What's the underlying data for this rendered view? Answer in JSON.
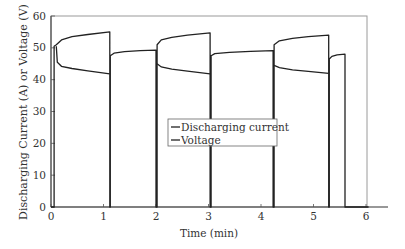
{
  "chart_data": {
    "type": "line",
    "title": "",
    "xlabel": "Time (min)",
    "ylabel": "Discharging Current (A) or Voltage (V)",
    "xlim": [
      0,
      6.05
    ],
    "ylim": [
      0,
      60
    ],
    "xticks": [
      0,
      1,
      2,
      3,
      4,
      5,
      6
    ],
    "yticks": [
      0,
      10,
      20,
      30,
      40,
      50,
      60
    ],
    "grid": false,
    "legend": {
      "position": "center",
      "entries": [
        "Discharging current",
        "Voltage"
      ]
    },
    "series": [
      {
        "name": "Discharging current",
        "color": "#222222",
        "points": [
          [
            0.0,
            0
          ],
          [
            0.06,
            0
          ],
          [
            0.06,
            50.5
          ],
          [
            0.1,
            51
          ],
          [
            0.2,
            52.5
          ],
          [
            0.4,
            53.5
          ],
          [
            0.7,
            54.2
          ],
          [
            1.12,
            55
          ],
          [
            1.12,
            0
          ],
          [
            1.13,
            0
          ],
          [
            1.13,
            47.5
          ],
          [
            1.2,
            48.3
          ],
          [
            1.4,
            48.8
          ],
          [
            1.7,
            49.1
          ],
          [
            2.0,
            49.3
          ],
          [
            2.0,
            0
          ],
          [
            2.02,
            0
          ],
          [
            2.02,
            51
          ],
          [
            2.1,
            52.5
          ],
          [
            2.3,
            53.3
          ],
          [
            2.6,
            54
          ],
          [
            3.03,
            54.7
          ],
          [
            3.03,
            0
          ],
          [
            3.05,
            0
          ],
          [
            3.05,
            47.5
          ],
          [
            3.12,
            48.2
          ],
          [
            3.4,
            48.6
          ],
          [
            3.8,
            48.9
          ],
          [
            4.23,
            49.1
          ],
          [
            4.23,
            0
          ],
          [
            4.25,
            0
          ],
          [
            4.25,
            51
          ],
          [
            4.35,
            52.2
          ],
          [
            4.6,
            53
          ],
          [
            4.9,
            53.5
          ],
          [
            5.29,
            54
          ],
          [
            5.29,
            0
          ],
          [
            5.3,
            0
          ],
          [
            5.3,
            46.5
          ],
          [
            5.35,
            47.3
          ],
          [
            5.45,
            47.8
          ],
          [
            5.6,
            48
          ],
          [
            5.6,
            0
          ],
          [
            6.05,
            0
          ]
        ]
      },
      {
        "name": "Voltage",
        "color": "#222222",
        "points": [
          [
            0.1,
            50.5
          ],
          [
            0.12,
            45.5
          ],
          [
            0.2,
            44.2
          ],
          [
            0.4,
            43.5
          ],
          [
            0.7,
            42.8
          ],
          [
            1.12,
            41.8
          ],
          [
            2.02,
            45
          ],
          [
            2.1,
            44
          ],
          [
            2.3,
            43.3
          ],
          [
            2.6,
            42.7
          ],
          [
            3.03,
            41.8
          ],
          [
            4.25,
            44.5
          ],
          [
            4.35,
            43.8
          ],
          [
            4.6,
            43.1
          ],
          [
            4.9,
            42.6
          ],
          [
            5.29,
            42
          ]
        ]
      }
    ]
  },
  "axes": {
    "ylabel": "Discharging Current (A) or Voltage (V)",
    "xlabel": "Time (min)",
    "y_tick_labels": [
      "0",
      "10",
      "20",
      "30",
      "40",
      "50",
      "60"
    ],
    "x_tick_labels": [
      "0",
      "1",
      "2",
      "3",
      "4",
      "5",
      "6"
    ]
  },
  "legend": {
    "items": [
      {
        "label": "Discharging current"
      },
      {
        "label": "Voltage"
      }
    ]
  }
}
